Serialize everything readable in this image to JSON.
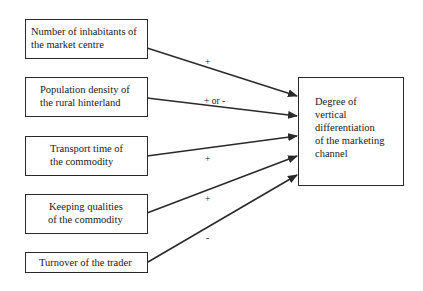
{
  "diagram": {
    "factors": [
      {
        "line1": "Number of inhabitants of",
        "line2": "the market centre",
        "sign": "+"
      },
      {
        "line1": "Population density of",
        "line2": "the rural hinterland",
        "sign": "+ or -"
      },
      {
        "line1": "Transport time of",
        "line2": "the commodity",
        "sign": "+"
      },
      {
        "line1": "Keeping qualities",
        "line2": "of the commodity",
        "sign": "+"
      },
      {
        "line1": "Turnover of the trader",
        "line2": "",
        "sign": "-"
      }
    ],
    "outcome": {
      "lines": [
        "Degree of",
        "vertical",
        "differentiation",
        "of the marketing",
        "channel"
      ]
    },
    "colors": {
      "line": "#2a2a2a",
      "background": "#ffffff"
    }
  }
}
